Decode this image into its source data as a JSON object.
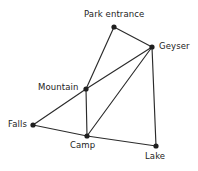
{
  "diagram": {
    "type": "node-link-graph",
    "background_color": "#ffffff",
    "edge_color": "#2b2b2b",
    "node_color": "#1f1f1f",
    "label_color": "#232323",
    "nodes": [
      {
        "id": "park_entrance",
        "label": "Park entrance",
        "x": 114,
        "y": 27,
        "label_x": 84,
        "label_y": 9,
        "label_anchor": "above"
      },
      {
        "id": "geyser",
        "label": "Geyser",
        "x": 152,
        "y": 47,
        "label_x": 159,
        "label_y": 41,
        "label_anchor": "right"
      },
      {
        "id": "mountain",
        "label": "Mountain",
        "x": 86,
        "y": 89,
        "label_x": 38,
        "label_y": 82,
        "label_anchor": "left"
      },
      {
        "id": "falls",
        "label": "Falls",
        "x": 33,
        "y": 125,
        "label_x": 8,
        "label_y": 119,
        "label_anchor": "left"
      },
      {
        "id": "camp",
        "label": "Camp",
        "x": 87,
        "y": 136,
        "label_x": 70,
        "label_y": 140,
        "label_anchor": "below"
      },
      {
        "id": "lake",
        "label": "Lake",
        "x": 156,
        "y": 146,
        "label_x": 145,
        "label_y": 151,
        "label_anchor": "below"
      }
    ],
    "edges": [
      {
        "from": "park_entrance",
        "to": "geyser"
      },
      {
        "from": "park_entrance",
        "to": "mountain"
      },
      {
        "from": "geyser",
        "to": "mountain"
      },
      {
        "from": "geyser",
        "to": "camp"
      },
      {
        "from": "geyser",
        "to": "lake"
      },
      {
        "from": "mountain",
        "to": "falls"
      },
      {
        "from": "mountain",
        "to": "camp"
      },
      {
        "from": "falls",
        "to": "camp"
      },
      {
        "from": "camp",
        "to": "lake"
      }
    ]
  }
}
